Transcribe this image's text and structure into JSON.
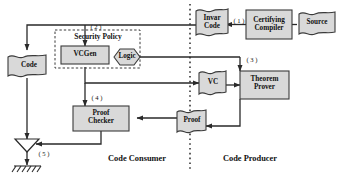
{
  "diagram": {
    "colors": {
      "fill": "#d9d9d9",
      "stroke": "#3b3b3b",
      "text": "#111111",
      "background": "#ffffff",
      "divider": "#1a1a1a"
    },
    "zones": [
      {
        "id": "consumer",
        "label": "Code Consumer"
      },
      {
        "id": "producer",
        "label": "Code Producer"
      }
    ],
    "nodes": [
      {
        "id": "security-policy",
        "label": "Security Policy",
        "shape": "dashed-container"
      },
      {
        "id": "vcgen",
        "label": "VCGen",
        "shape": "process"
      },
      {
        "id": "logic",
        "label": "Logic",
        "shape": "hexagon"
      },
      {
        "id": "code",
        "label": "Code",
        "shape": "document"
      },
      {
        "id": "proof-checker",
        "label": "Proof\nChecker",
        "shape": "process"
      },
      {
        "id": "merge",
        "label": "",
        "shape": "triangle"
      },
      {
        "id": "ground",
        "label": "",
        "shape": "ground"
      },
      {
        "id": "invar-code",
        "label": "Invar\nCode",
        "shape": "document"
      },
      {
        "id": "certifying-compiler",
        "label": "Certifying\nCompiler",
        "shape": "process"
      },
      {
        "id": "source",
        "label": "Source",
        "shape": "document"
      },
      {
        "id": "vc",
        "label": "VC",
        "shape": "document"
      },
      {
        "id": "theorem-prover",
        "label": "Theorem\nProver",
        "shape": "process"
      },
      {
        "id": "proof",
        "label": "Proof",
        "shape": "document"
      }
    ],
    "step_labels": [
      {
        "id": "step-1",
        "label": "( 1 )"
      },
      {
        "id": "step-2",
        "label": "( 2 )"
      },
      {
        "id": "step-3",
        "label": "( 3 )"
      },
      {
        "id": "step-4",
        "label": "( 4 )"
      },
      {
        "id": "step-5",
        "label": "( 5 )"
      }
    ]
  }
}
